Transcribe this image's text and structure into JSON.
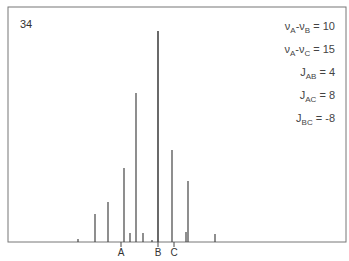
{
  "figure": {
    "number_label": "34"
  },
  "parameters": [
    {
      "lhs_main": "ν",
      "lhs_sub": "A",
      "minus": "-",
      "rhs_main": "ν",
      "rhs_sub": "B",
      "eq": " = ",
      "value": "10"
    },
    {
      "lhs_main": "ν",
      "lhs_sub": "A",
      "minus": "-",
      "rhs_main": "ν",
      "rhs_sub": "C",
      "eq": " = ",
      "value": "15"
    },
    {
      "lhs_main": "J",
      "lhs_sub": "AB",
      "eq": " = ",
      "value": "4"
    },
    {
      "lhs_main": "J",
      "lhs_sub": "AC",
      "eq": " = ",
      "value": "8"
    },
    {
      "lhs_main": "J",
      "lhs_sub": "BC",
      "eq": " = ",
      "value": "-8"
    }
  ],
  "chart_data": {
    "type": "bar",
    "title": "",
    "subtitle": "Simulated NMR stick spectrum (ABC spin system)",
    "xlabel": "",
    "ylabel": "",
    "grid": false,
    "legend": "none",
    "x_ticks": [
      {
        "label": "A",
        "x_px": 121
      },
      {
        "label": "B",
        "x_px": 158
      },
      {
        "label": "C",
        "x_px": 174
      }
    ],
    "lines": [
      {
        "x_px": 78,
        "height_px": 3
      },
      {
        "x_px": 95,
        "height_px": 28
      },
      {
        "x_px": 108,
        "height_px": 40
      },
      {
        "x_px": 124,
        "height_px": 74
      },
      {
        "x_px": 130,
        "height_px": 9
      },
      {
        "x_px": 136,
        "height_px": 149
      },
      {
        "x_px": 143,
        "height_px": 9
      },
      {
        "x_px": 152,
        "height_px": 2
      },
      {
        "x_px": 158,
        "height_px": 211
      },
      {
        "x_px": 172,
        "height_px": 92
      },
      {
        "x_px": 186,
        "height_px": 10
      },
      {
        "x_px": 188,
        "height_px": 61
      },
      {
        "x_px": 215,
        "height_px": 8
      }
    ],
    "baseline_px": 242
  }
}
